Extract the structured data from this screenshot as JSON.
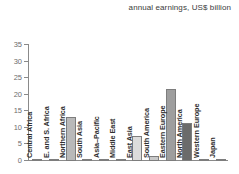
{
  "chart_data": {
    "type": "bar",
    "title": "annual earnings, US$ billion",
    "xlabel": "",
    "ylabel": "",
    "ylim": [
      0,
      35
    ],
    "yticks": [
      0,
      5,
      10,
      15,
      20,
      25,
      30,
      35
    ],
    "grid": false,
    "legend": null,
    "categories": [
      "Central Africa",
      "E. and S. Africa",
      "Northern Africa",
      "South Asia",
      "Asia–Pacific",
      "Middle East",
      "East Asia",
      "South America",
      "Eastern Europe",
      "North America",
      "Western Europe",
      "Japan"
    ],
    "values": [
      0.1,
      0.35,
      13.2,
      0.1,
      0.45,
      0.1,
      7.5,
      1.5,
      21.7,
      11.5,
      0.1,
      0.1
    ],
    "bar_colors": [
      "#e8e8e8",
      "#d8d8d8",
      "#b9b9b9",
      "#e8e8e8",
      "#d8d8d8",
      "#e8e8e8",
      "#dcdcdc",
      "#c9c9c9",
      "#9e9e9e",
      "#6b6b6b",
      "#e8e8e8",
      "#e8e8e8"
    ]
  },
  "colors": {
    "axis": "#8a8a8a",
    "tick_text": "#6d6d6d",
    "category_text": "#2f2f2f",
    "title_text": "#3b3b3b",
    "background": "#ffffff"
  }
}
